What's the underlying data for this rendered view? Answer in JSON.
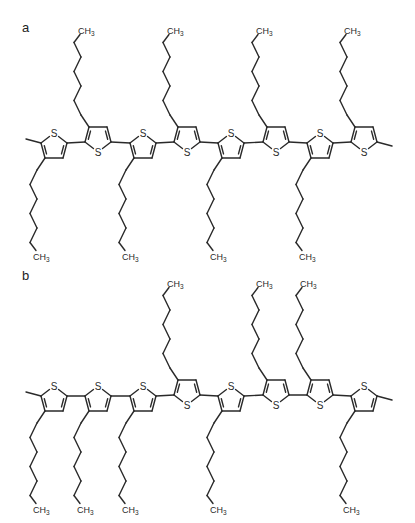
{
  "figure": {
    "panels": [
      {
        "label": "a",
        "label_pos": [
          22,
          33
        ],
        "baseline_y": 132,
        "left_methyl": true,
        "right_methyl": true,
        "rings": [
          {
            "cx": 54,
            "orient": "up"
          },
          {
            "cx": 98,
            "orient": "down"
          },
          {
            "cx": 143,
            "orient": "up"
          },
          {
            "cx": 187,
            "orient": "down"
          },
          {
            "cx": 231,
            "orient": "up"
          },
          {
            "cx": 276,
            "orient": "down"
          },
          {
            "cx": 320,
            "orient": "up"
          },
          {
            "cx": 364,
            "orient": "down"
          }
        ]
      },
      {
        "label": "b",
        "label_pos": [
          22,
          281
        ],
        "baseline_y": 385,
        "left_methyl": true,
        "right_methyl": true,
        "rings": [
          {
            "cx": 54,
            "orient": "up"
          },
          {
            "cx": 98,
            "orient": "up"
          },
          {
            "cx": 143,
            "orient": "up"
          },
          {
            "cx": 187,
            "orient": "down"
          },
          {
            "cx": 231,
            "orient": "up"
          },
          {
            "cx": 276,
            "orient": "down"
          },
          {
            "cx": 320,
            "orient": "down"
          },
          {
            "cx": 364,
            "orient": "up"
          }
        ]
      }
    ],
    "atom_labels": {
      "sulfur": "S",
      "methyl_terminal": "CH3"
    },
    "side_chain": "hexyl",
    "repeat_unit": "3-hexylthiophene",
    "colors": {
      "line": "#2a2a2a",
      "background": "#ffffff"
    }
  }
}
